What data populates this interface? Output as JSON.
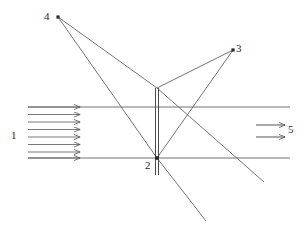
{
  "figure": {
    "background": "#ffffff",
    "stroke_color": "#555555",
    "dark_stroke_color": "#3a3a3a",
    "label_color": "#2b2b2b",
    "width": 307,
    "height": 238
  },
  "labels": {
    "one": "1",
    "two": "2",
    "three": "3",
    "four": "4",
    "five": "5"
  },
  "diagram_data": {
    "type": "ray-diagram",
    "points": [
      {
        "name": "point-4",
        "label": "4",
        "x": 58,
        "y": 17
      },
      {
        "name": "point-3",
        "label": "3",
        "x": 233,
        "y": 50
      },
      {
        "name": "point-2",
        "label": "2",
        "x": 157,
        "y": 158
      }
    ],
    "mirror": {
      "x": 157,
      "y_top": 88,
      "y_bottom": 175,
      "style": "double-line"
    },
    "beam_boundaries": [
      {
        "name": "upper-boundary",
        "y": 107,
        "x1": 28,
        "x2": 290
      },
      {
        "name": "lower-boundary",
        "y": 158,
        "x1": 28,
        "x2": 290
      }
    ],
    "incoming_arrows": {
      "label": "1",
      "count": 7,
      "x_start": 28,
      "x_end": 80,
      "y_values": [
        107,
        114,
        121,
        128,
        135,
        142,
        149,
        158
      ]
    },
    "outgoing_arrows": {
      "label": "5",
      "count": 2,
      "x_start": 256,
      "x_end": 284,
      "y_values": [
        124,
        136
      ]
    },
    "rays": [
      {
        "from": "point-4",
        "to": "mirror-top",
        "x1": 58,
        "y1": 17,
        "x2": 157,
        "y2": 88
      },
      {
        "from": "point-4",
        "to": "point-2",
        "x1": 58,
        "y1": 17,
        "x2": 157,
        "y2": 158
      },
      {
        "from": "point-3",
        "to": "mirror-top",
        "x1": 233,
        "y1": 50,
        "x2": 157,
        "y2": 88
      },
      {
        "from": "point-3",
        "to": "point-2",
        "x1": 233,
        "y1": 50,
        "x2": 157,
        "y2": 158
      },
      {
        "from": "mirror-top",
        "to": "lower-right",
        "x1": 157,
        "y1": 88,
        "x2": 264,
        "y2": 182
      },
      {
        "from": "point-2",
        "to": "bottom-right",
        "x1": 157,
        "y1": 158,
        "x2": 206,
        "y2": 221
      }
    ]
  }
}
